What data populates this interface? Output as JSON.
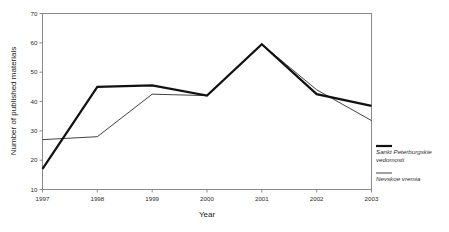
{
  "chart_data": {
    "type": "line",
    "title": "",
    "xlabel": "Year",
    "ylabel": "Number of published materials",
    "categories": [
      "1997",
      "1998",
      "1999",
      "2000",
      "2001",
      "2002",
      "2003"
    ],
    "x": [
      1997,
      1998,
      1999,
      2000,
      2001,
      2002,
      2003
    ],
    "xlim": [
      1997,
      2003
    ],
    "ylim": [
      10,
      70
    ],
    "yticks": [
      10,
      20,
      30,
      40,
      50,
      60,
      70
    ],
    "xticks": [
      "1997",
      "1998",
      "1999",
      "2000",
      "2001",
      "2002",
      "2003"
    ],
    "grid": false,
    "legend_position": "right",
    "series": [
      {
        "name": "Sankt Peterburgskie vedomosti",
        "values": [
          17,
          45,
          45.5,
          42,
          59.5,
          42.5,
          38.5
        ],
        "color": "#111111",
        "line_width": 2.2,
        "style": "bold"
      },
      {
        "name": "Nevskoe vremia",
        "values": [
          27,
          28,
          42.5,
          42,
          59.5,
          44,
          33.5
        ],
        "color": "#111111",
        "line_width": 0.8,
        "style": "thin"
      }
    ]
  },
  "axes": {
    "y_title": "Number of published materials",
    "x_title": "Year"
  },
  "legend": {
    "entries": [
      {
        "label_line1": "Sankt Peterburgskie",
        "label_line2": "vedomosti",
        "full": "Sankt Peterburgskie vedomosti"
      },
      {
        "label_line1": "Nevskoe vremia",
        "label_line2": "",
        "full": "Nevskoe vremia"
      }
    ]
  },
  "ticks": {
    "y": [
      "70",
      "60",
      "50",
      "40",
      "30",
      "20",
      "10"
    ],
    "x": [
      "1997",
      "1998",
      "1999",
      "2000",
      "2001",
      "2002",
      "2003"
    ]
  }
}
